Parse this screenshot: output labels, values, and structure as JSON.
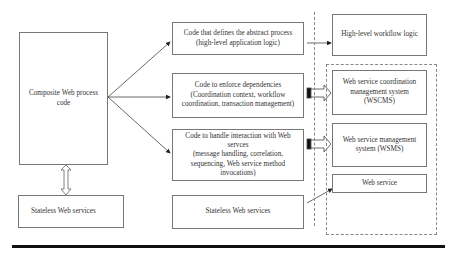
{
  "diagram": {
    "left": {
      "composite": "Composite Web process code",
      "stateless": "Stateless Web services"
    },
    "middle": {
      "abstract": "Code that defines the abstract process (high-level application logic)",
      "dependencies": "Code to enforce dependencies (Coordination context, workflow coordination, transaction management)",
      "interaction_title": "Code to handle interaction with Web servces",
      "interaction_detail": "(message handling, correlation, sequencing, Web service method invocations)",
      "stateless": "Stateless Web services"
    },
    "right": {
      "workflow": "High-level workflow logic",
      "wscms": "Web service coordination management system (WSCMS)",
      "wsms": "Web service management system (WSMS)",
      "webservice": "Web service"
    }
  }
}
